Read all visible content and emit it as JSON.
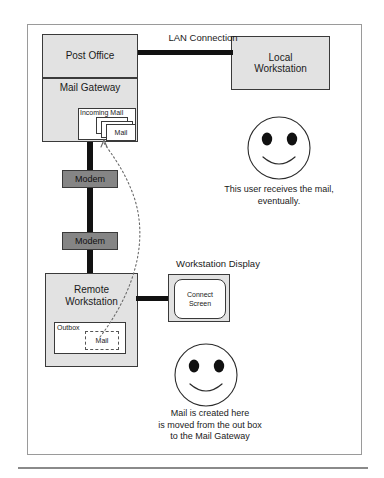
{
  "diagram": {
    "nodes": {
      "post_office": "Post Office",
      "mail_gateway": "Mail Gateway",
      "local_workstation": "Local\nWorkstation",
      "local_workstation_line1": "Local",
      "local_workstation_line2": "Workstation",
      "incoming_mail": "Incoming Mail",
      "mail_item_top": "Mail",
      "modem_upper": "Modem",
      "modem_lower": "Modem",
      "remote_workstation_line1": "Remote",
      "remote_workstation_line2": "Workstation",
      "outbox": "Outbox",
      "outbox_mail": "Mail",
      "workstation_display": "Workstation Display",
      "connect_screen_line1": "Connect",
      "connect_screen_line2": "Screen"
    },
    "links": {
      "lan_connection": "LAN Connection"
    },
    "captions": {
      "receiver_line1": "This user receives the mail,",
      "receiver_line2": "eventually.",
      "sender_line1": "Mail is created here",
      "sender_line2": "is moved from the out box",
      "sender_line3": "to the Mail Gateway"
    },
    "icons": {
      "receiver_face": "smiley-face-icon",
      "sender_face": "smiley-face-icon",
      "mail_flow": "dotted-flow-arrow-icon"
    },
    "colors": {
      "node_fill": "#e2e2e2",
      "modem_fill": "#858585",
      "paper_fill": "#ffffff",
      "stroke": "#3a3a3a",
      "connector": "#111111",
      "frame": "#9a9a9a"
    }
  }
}
